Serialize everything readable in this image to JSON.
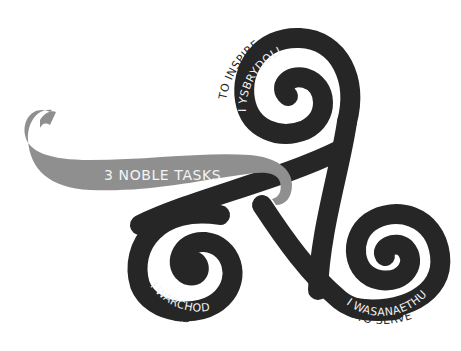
{
  "title": "3 NOBLE TASKS",
  "colors": {
    "spiral": "#262626",
    "banner": "#8f8f8f",
    "background": "#ffffff",
    "label_on_dark": "#f2f2f2"
  },
  "tasks": [
    {
      "position": "top",
      "welsh": "I YSBRYDOLI",
      "english": "TO INSPIRE"
    },
    {
      "position": "bottom-left",
      "welsh": "I WARCHOD",
      "english": "TO GUARD"
    },
    {
      "position": "bottom-right",
      "welsh": "I WASANAETHU",
      "english": "TO SERVE"
    }
  ]
}
